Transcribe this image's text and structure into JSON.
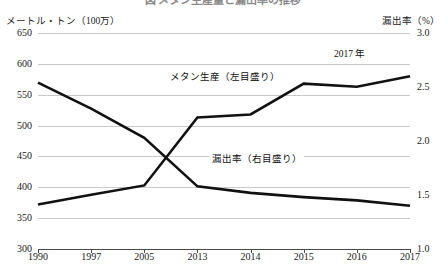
{
  "figure": {
    "title": "図 メタン生産量と漏出率の推移",
    "left_axis_caption": "メートル・トン（100万）",
    "right_axis_caption": "漏出率（%）"
  },
  "annotations": {
    "production": "メタン生産（左目盛り）",
    "leakage": "漏出率（右目盛り）",
    "year_mark": "2017 年"
  },
  "chart_data": {
    "type": "line",
    "title": "メタン生産量と漏出率の推移",
    "xlabel": "",
    "ylabel": "メートル・トン（100万）",
    "y2label": "漏出率（%）",
    "grid": true,
    "legend": "inline-annotations",
    "categories": [
      "1990",
      "1997",
      "2005",
      "2013",
      "2014",
      "2015",
      "2016",
      "2017"
    ],
    "left_axis": {
      "label": "メートル・トン（100万）",
      "ticks": [
        300,
        350,
        400,
        450,
        500,
        550,
        600,
        650
      ],
      "tick_labels": [
        "300",
        "350",
        "400",
        "450",
        "500",
        "550",
        "600",
        "650"
      ],
      "ylim": [
        300,
        650
      ]
    },
    "right_axis": {
      "label": "漏出率（%）",
      "ticks": [
        1.0,
        1.5,
        2.0,
        2.5,
        3.0
      ],
      "tick_labels": [
        "1.0",
        "1.5",
        "2.0",
        "2.5",
        "3.0"
      ],
      "ylim": [
        1.0,
        3.0
      ]
    },
    "series": [
      {
        "name": "メタン生産（左目盛り）",
        "axis": "left",
        "unit": "メートル・トン（100万）",
        "values": [
          372,
          388,
          403,
          513,
          518,
          568,
          563,
          580
        ]
      },
      {
        "name": "漏出率（右目盛り）",
        "axis": "right",
        "unit": "%",
        "values": [
          2.54,
          2.3,
          2.03,
          1.58,
          1.52,
          1.48,
          1.45,
          1.4
        ]
      }
    ]
  }
}
